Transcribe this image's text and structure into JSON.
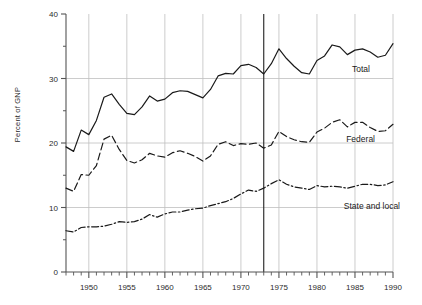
{
  "chart_data": {
    "type": "line",
    "title": "",
    "xlabel": "",
    "ylabel": "Percent of GNP",
    "xlim": [
      1947,
      1990
    ],
    "ylim": [
      0,
      40
    ],
    "grid": "horizontal-and-vertical",
    "legend_position": "inline-right-of-each-series",
    "y_ticks_major": [
      0,
      10,
      20,
      30,
      40
    ],
    "y_ticks_minor": [
      5,
      15,
      25,
      35
    ],
    "x_ticks_major": [
      1950,
      1955,
      1960,
      1965,
      1970,
      1975,
      1980,
      1985,
      1990
    ],
    "x_tick_labels": [
      "1950",
      "1955",
      "1960",
      "1965",
      "1970",
      "1975",
      "1980",
      "1985",
      "1990"
    ],
    "x_ticks_minor_every": 1,
    "annotations": [
      {
        "name": "marker-1973",
        "type": "vline",
        "x": 1973,
        "color": "#333333"
      }
    ],
    "x": [
      1947,
      1948,
      1949,
      1950,
      1951,
      1952,
      1953,
      1954,
      1955,
      1956,
      1957,
      1958,
      1959,
      1960,
      1961,
      1962,
      1963,
      1964,
      1965,
      1966,
      1967,
      1968,
      1969,
      1970,
      1971,
      1972,
      1973,
      1974,
      1975,
      1976,
      1977,
      1978,
      1979,
      1980,
      1981,
      1982,
      1983,
      1984,
      1985,
      1986,
      1987,
      1988,
      1989,
      1990
    ],
    "series": [
      {
        "name": "Total",
        "label": "Total",
        "style": "solid",
        "color": "#1a1a1a",
        "values": [
          19.4,
          18.7,
          22.0,
          21.3,
          23.5,
          27.1,
          27.6,
          26.0,
          24.6,
          24.4,
          25.6,
          27.3,
          26.5,
          26.8,
          27.8,
          28.1,
          28.0,
          27.5,
          27.0,
          28.3,
          30.4,
          30.8,
          30.7,
          32.0,
          32.2,
          31.7,
          30.7,
          32.3,
          34.6,
          33.1,
          31.9,
          30.9,
          30.7,
          32.8,
          33.5,
          35.2,
          34.9,
          33.7,
          34.4,
          34.6,
          34.1,
          33.3,
          33.6,
          35.4
        ]
      },
      {
        "name": "Federal",
        "label": "Federal",
        "style": "dashed",
        "color": "#1a1a1a",
        "values": [
          13.0,
          12.5,
          15.1,
          15.0,
          16.5,
          20.6,
          21.2,
          19.0,
          17.3,
          16.9,
          17.4,
          18.4,
          18.0,
          17.8,
          18.5,
          18.8,
          18.4,
          17.9,
          17.2,
          18.0,
          19.8,
          20.2,
          19.6,
          19.9,
          19.8,
          20.0,
          19.2,
          19.7,
          21.8,
          21.0,
          20.5,
          20.2,
          20.1,
          21.7,
          22.3,
          23.2,
          23.6,
          22.5,
          23.2,
          23.2,
          22.4,
          21.8,
          21.9,
          22.9
        ]
      },
      {
        "name": "State and local",
        "label": "State and local",
        "style": "dashdot",
        "color": "#1a1a1a",
        "values": [
          6.4,
          6.2,
          6.9,
          7.0,
          7.0,
          7.1,
          7.4,
          7.8,
          7.7,
          7.8,
          8.2,
          8.9,
          8.5,
          9.0,
          9.3,
          9.3,
          9.6,
          9.8,
          9.9,
          10.3,
          10.6,
          10.9,
          11.4,
          12.1,
          12.7,
          12.5,
          13.0,
          13.7,
          14.3,
          13.6,
          13.2,
          13.0,
          12.8,
          13.4,
          13.2,
          13.3,
          13.2,
          13.0,
          13.3,
          13.6,
          13.6,
          13.4,
          13.5,
          14.0
        ]
      }
    ]
  }
}
